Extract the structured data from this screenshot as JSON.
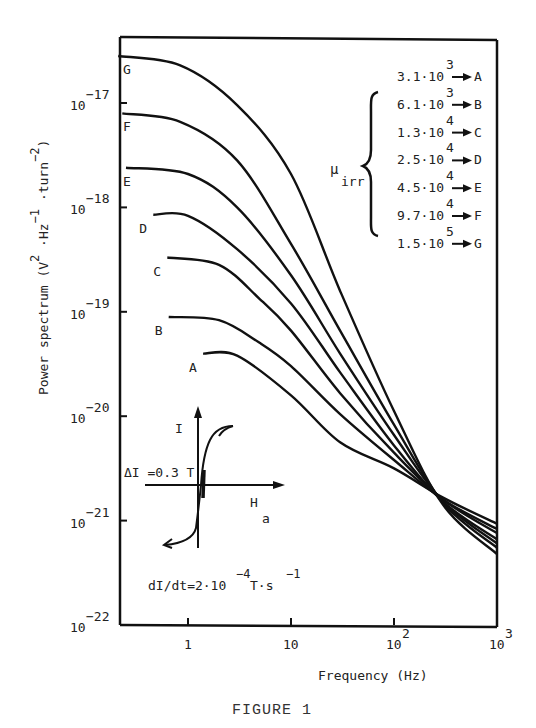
{
  "figure": {
    "caption": "FIGURE 1"
  },
  "chart_data": {
    "type": "line",
    "title": "",
    "xlabel": "Frequency (Hz)",
    "ylabel": "Power spectrum (V²·Hz⁻¹·turn⁻²)",
    "xscale": "log",
    "yscale": "log",
    "xlim": [
      0.21,
      1000
    ],
    "ylim": [
      1e-22,
      4e-17
    ],
    "x_ticks": [
      {
        "value": 1,
        "label": "1"
      },
      {
        "value": 10,
        "label": "10"
      },
      {
        "value": 100,
        "label": "10",
        "sup": "2"
      },
      {
        "value": 1000,
        "label": "10",
        "sup": "3"
      }
    ],
    "y_ticks": [
      {
        "exp": -17,
        "label": "10",
        "sup": "−17"
      },
      {
        "exp": -18,
        "label": "10",
        "sup": "−18"
      },
      {
        "exp": -19,
        "label": "10",
        "sup": "−19"
      },
      {
        "exp": -20,
        "label": "10",
        "sup": "−20"
      },
      {
        "exp": -21,
        "label": "10",
        "sup": "−21"
      },
      {
        "exp": -22,
        "label": "10",
        "sup": "−22"
      }
    ],
    "grid": false,
    "legend": {
      "title": "μ",
      "title_sub": "irr",
      "position": "upper right",
      "entries": [
        {
          "value": "3.1·10",
          "exp": "3",
          "series": "A"
        },
        {
          "value": "6.1·10",
          "exp": "3",
          "series": "B"
        },
        {
          "value": "1.3·10",
          "exp": "4",
          "series": "C"
        },
        {
          "value": "2.5·10",
          "exp": "4",
          "series": "D"
        },
        {
          "value": "4.5·10",
          "exp": "4",
          "series": "E"
        },
        {
          "value": "9.7·10",
          "exp": "4",
          "series": "F"
        },
        {
          "value": "1.5·10",
          "exp": "5",
          "series": "G"
        }
      ]
    },
    "series": [
      {
        "name": "A",
        "mu_irr": 3100,
        "points": [
          [
            1.4,
            -19.4
          ],
          [
            3,
            -19.42
          ],
          [
            10,
            -19.8
          ],
          [
            30,
            -20.25
          ],
          [
            100,
            -20.5
          ],
          [
            300,
            -20.78
          ],
          [
            1000,
            -21.03
          ]
        ]
      },
      {
        "name": "B",
        "mu_irr": 6100,
        "points": [
          [
            0.65,
            -19.05
          ],
          [
            2,
            -19.08
          ],
          [
            5,
            -19.3
          ],
          [
            10,
            -19.52
          ],
          [
            30,
            -19.98
          ],
          [
            100,
            -20.42
          ],
          [
            300,
            -20.8
          ],
          [
            1000,
            -21.08
          ]
        ]
      },
      {
        "name": "C",
        "mu_irr": 13000,
        "points": [
          [
            0.63,
            -18.48
          ],
          [
            2,
            -18.55
          ],
          [
            5,
            -18.88
          ],
          [
            10,
            -19.18
          ],
          [
            30,
            -19.78
          ],
          [
            100,
            -20.35
          ],
          [
            300,
            -20.8
          ],
          [
            1000,
            -21.12
          ]
        ]
      },
      {
        "name": "D",
        "mu_irr": 25000,
        "points": [
          [
            0.46,
            -18.07
          ],
          [
            1,
            -18.08
          ],
          [
            3,
            -18.4
          ],
          [
            10,
            -18.92
          ],
          [
            30,
            -19.58
          ],
          [
            100,
            -20.28
          ],
          [
            300,
            -20.82
          ],
          [
            1000,
            -21.18
          ]
        ]
      },
      {
        "name": "E",
        "mu_irr": 45000,
        "points": [
          [
            0.25,
            -17.62
          ],
          [
            1,
            -17.68
          ],
          [
            3,
            -18.0
          ],
          [
            10,
            -18.65
          ],
          [
            30,
            -19.4
          ],
          [
            100,
            -20.18
          ],
          [
            300,
            -20.82
          ],
          [
            1000,
            -21.22
          ]
        ]
      },
      {
        "name": "F",
        "mu_irr": 97000,
        "points": [
          [
            0.23,
            -17.1
          ],
          [
            0.84,
            -17.18
          ],
          [
            3,
            -17.55
          ],
          [
            10,
            -18.35
          ],
          [
            30,
            -19.18
          ],
          [
            100,
            -20.08
          ],
          [
            300,
            -20.83
          ],
          [
            1000,
            -21.26
          ]
        ]
      },
      {
        "name": "G",
        "mu_irr": 150000,
        "points": [
          [
            0.21,
            -16.55
          ],
          [
            0.84,
            -16.64
          ],
          [
            3,
            -17.02
          ],
          [
            10,
            -17.68
          ],
          [
            30,
            -18.8
          ],
          [
            100,
            -19.95
          ],
          [
            300,
            -20.85
          ],
          [
            1000,
            -21.32
          ]
        ]
      }
    ],
    "annotations": [
      {
        "id": "delta-i",
        "text": "ΔI =0.3 T"
      },
      {
        "id": "rate",
        "text": "dI/dt=2·10",
        "sup": "−4",
        "tail": "T·s",
        "tail_sup": "−1"
      },
      {
        "id": "inset-y",
        "text": "I"
      },
      {
        "id": "inset-x",
        "text": "H",
        "sub": "a"
      }
    ],
    "inset": {
      "type": "hysteresis-loop",
      "x_axis": "Ha",
      "y_axis": "I"
    }
  }
}
